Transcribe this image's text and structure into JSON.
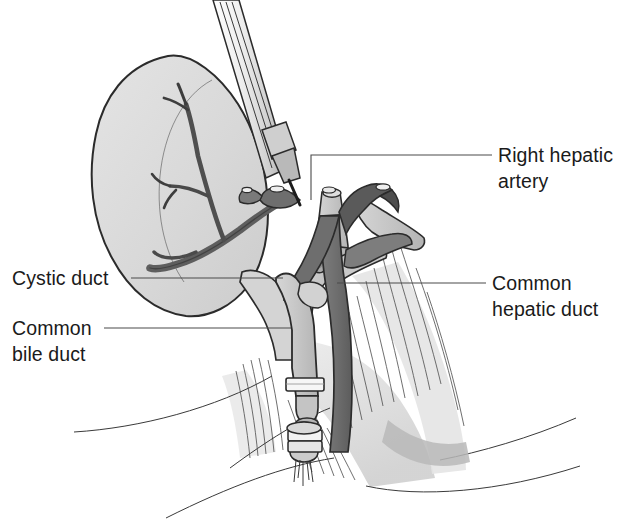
{
  "figure": {
    "background_color": "#ffffff",
    "width": 623,
    "height": 526
  },
  "labels": [
    {
      "id": "right-hepatic-artery",
      "lines": [
        "Right hepatic",
        "artery"
      ],
      "line1": "Right hepatic",
      "line2": "artery",
      "text_x": 498,
      "text_y": 162,
      "anchor": "start",
      "leader_path": "M 492 155 L 311 155 L 311 200"
    },
    {
      "id": "common-hepatic-duct",
      "lines": [
        "Common",
        "hepatic duct"
      ],
      "line1": "Common",
      "line2": "hepatic duct",
      "text_x": 492,
      "text_y": 290,
      "anchor": "start",
      "leader_path": "M 486 283 L 337 283"
    },
    {
      "id": "cystic-duct",
      "lines": [
        "Cystic duct"
      ],
      "line1": "Cystic duct",
      "line2": "",
      "text_x": 12,
      "text_y": 285,
      "anchor": "start",
      "leader_path": "M 131 278 L 283 278"
    },
    {
      "id": "common-bile-duct",
      "lines": [
        "Common",
        "bile duct"
      ],
      "line1": "Common",
      "line2": "bile duct",
      "text_x": 12,
      "text_y": 335,
      "anchor": "start",
      "leader_path": "M 104 328 L 291 328"
    }
  ],
  "anatomy": {
    "gallbladder": {
      "name": "gallbladder",
      "fill": "#dcdcdc",
      "outline": "#2b2b2b"
    },
    "cystic_artery": {
      "name": "cystic artery",
      "fill": "#6e6e6e",
      "outline": "#2b2b2b"
    },
    "right_hepatic_artery": {
      "name": "right hepatic artery",
      "fill": "#6e6e6e",
      "outline": "#2b2b2b"
    },
    "hepatic_duct": {
      "name": "common hepatic duct",
      "fill": "#c9c9c9",
      "outline": "#2b2b2b"
    },
    "common_bile_duct": {
      "name": "common bile duct",
      "fill": "#c9c9c9",
      "outline": "#2b2b2b"
    },
    "surgical_clips": {
      "name": "surgical clips",
      "fill": "#f2f2f2",
      "outline": "#2b2b2b",
      "count": 4
    },
    "dissector_instrument": {
      "name": "dissecting instrument",
      "fill": "#ececec",
      "outline": "#2b2b2b"
    },
    "background_tissue": {
      "name": "connective tissue",
      "fill": "#e6e6e6",
      "outline": "#555555"
    }
  }
}
